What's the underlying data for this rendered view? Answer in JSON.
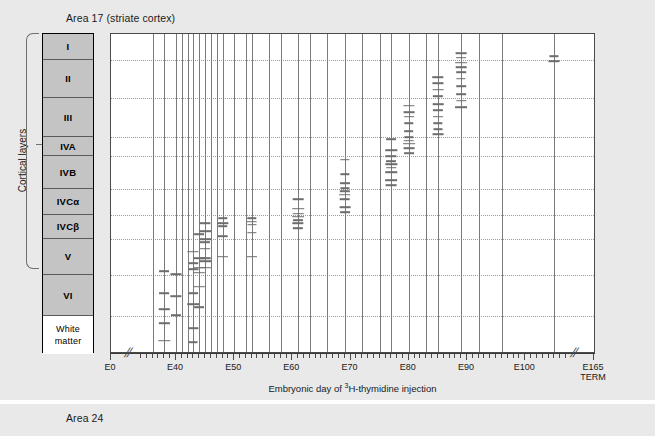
{
  "figure": {
    "panels": [
      {
        "id": "area17",
        "title": "Area 17 (striate cortex)"
      },
      {
        "id": "area24",
        "title": "Area 24"
      }
    ]
  },
  "axes": {
    "y_label": "Cortical layers",
    "x_label_html": "Embryonic day of <sup>3</sup>H-thymidine injection",
    "x_label_text": "Embryonic day of 3H-thymidine injection",
    "x_ticks": [
      {
        "value": 0,
        "label": "E0"
      },
      {
        "value": 40,
        "label": "E40"
      },
      {
        "value": 50,
        "label": "E50"
      },
      {
        "value": 60,
        "label": "E60"
      },
      {
        "value": 70,
        "label": "E70"
      },
      {
        "value": 80,
        "label": "E80"
      },
      {
        "value": 90,
        "label": "E90"
      },
      {
        "value": 100,
        "label": "E100"
      },
      {
        "value": 165,
        "label": "E165\nTERM"
      }
    ],
    "x_range": [
      0,
      165
    ],
    "x_breaks": [
      [
        2,
        34
      ],
      [
        107,
        160
      ]
    ],
    "minor_tick_step": 1,
    "minor_tick_range": [
      34,
      107
    ]
  },
  "layers": [
    {
      "name": "I",
      "top": 0,
      "height": 26,
      "shaded": true
    },
    {
      "name": "II",
      "top": 26,
      "height": 38,
      "shaded": true
    },
    {
      "name": "III",
      "top": 64,
      "height": 39,
      "shaded": true
    },
    {
      "name": "IVA",
      "top": 103,
      "height": 19,
      "shaded": true
    },
    {
      "name": "IVB",
      "top": 122,
      "height": 33,
      "shaded": true
    },
    {
      "name": "IVCα",
      "top": 155,
      "height": 26,
      "shaded": true
    },
    {
      "name": "IVCβ",
      "top": 181,
      "height": 24,
      "shaded": true
    },
    {
      "name": "V",
      "top": 205,
      "height": 36,
      "shaded": true
    },
    {
      "name": "VI",
      "top": 241,
      "height": 41,
      "shaded": true
    },
    {
      "name": "White\nmatter",
      "top": 282,
      "height": 38,
      "shaded": false,
      "line1": "White",
      "line2": "matter"
    }
  ],
  "chart_data": {
    "type": "scatter",
    "title": "Area 17 (striate cortex)",
    "xlabel": "Embryonic day of 3H-thymidine injection",
    "ylabel": "Cortical layers",
    "xlim": [
      0,
      165
    ],
    "ylim_layers": [
      "I",
      "II",
      "III",
      "IVA",
      "IVB",
      "IVCalpha",
      "IVCbeta",
      "V",
      "VI",
      "White matter"
    ],
    "grid": "dotted horizontal gridlines at layer boundaries",
    "legend": "none",
    "columns": [
      {
        "day": 38,
        "marks_depth_pct": [
          74.5,
          81.5,
          86.5,
          91.0,
          96.5
        ]
      },
      {
        "day": 40,
        "marks_depth_pct": [
          75.5,
          82.5,
          88.5
        ]
      },
      {
        "day": 43,
        "marks_depth_pct": [
          68.5,
          72.0,
          74.0,
          81.5,
          85.0,
          92.5,
          97.0
        ]
      },
      {
        "day": 44,
        "marks_depth_pct": [
          63.0,
          70.5,
          73.5,
          75.0,
          79.5,
          86.0
        ]
      },
      {
        "day": 45,
        "marks_depth_pct": [
          59.5,
          62.0,
          64.5,
          65.5,
          67.5,
          70.5,
          71.5,
          73.5
        ]
      },
      {
        "day": 48,
        "marks_depth_pct": [
          58.0,
          59.5,
          60.5,
          63.5,
          70.0
        ]
      },
      {
        "day": 53,
        "marks_depth_pct": [
          58.0,
          59.0,
          60.0,
          62.5,
          70.0
        ]
      },
      {
        "day": 61,
        "marks_depth_pct": [
          52.0,
          55.0,
          56.5,
          57.5,
          58.5,
          59.5,
          61.0
        ]
      },
      {
        "day": 69,
        "marks_depth_pct": [
          39.5,
          44.0,
          47.0,
          48.5,
          49.5,
          50.5,
          52.0,
          54.5,
          56.0
        ]
      },
      {
        "day": 77,
        "marks_depth_pct": [
          33.0,
          36.5,
          38.5,
          40.0,
          41.0,
          42.0,
          43.5,
          46.0,
          47.5
        ]
      },
      {
        "day": 80,
        "marks_depth_pct": [
          22.5,
          24.5,
          26.0,
          28.0,
          30.5,
          32.5,
          33.5,
          34.5,
          36.0,
          37.5
        ]
      },
      {
        "day": 85,
        "marks_depth_pct": [
          13.5,
          15.5,
          17.5,
          19.5,
          22.0,
          24.0,
          26.0,
          28.0,
          30.0,
          31.5
        ]
      },
      {
        "day": 89,
        "marks_depth_pct": [
          6.0,
          7.5,
          9.0,
          10.5,
          12.0,
          14.0,
          16.5,
          19.0,
          21.0,
          23.0
        ]
      },
      {
        "day": 105,
        "marks_depth_pct": [
          7.0,
          8.5
        ]
      }
    ],
    "plain_columns_days": [
      36,
      41,
      42,
      46,
      47,
      50,
      52,
      56,
      58,
      63,
      66,
      72,
      75,
      83,
      92,
      96
    ]
  },
  "colors": {
    "background": "#e9e9e9",
    "panel": "#ffffff",
    "layer_fill": "#c4c4c4",
    "mark": "#6d6d6d",
    "column_line": "#7b7b7b",
    "gridline": "#9a9a9a",
    "axis": "#3a3a3a",
    "text": "#1a1a1a"
  }
}
